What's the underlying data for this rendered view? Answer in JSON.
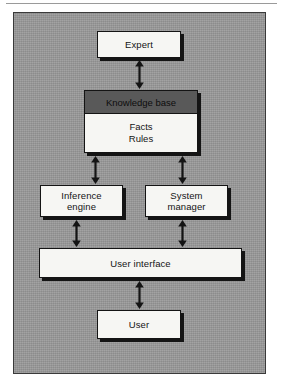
{
  "diagram": {
    "panel_color": "#9a9a9a",
    "box_fill": "#f6f6f3",
    "box_border": "#141414",
    "header_band_color": "#595959",
    "nodes": [
      {
        "id": "expert",
        "label": "Expert"
      },
      {
        "id": "knowledge-base",
        "header": "Knowledge base",
        "line1": "Facts",
        "line2": "Rules"
      },
      {
        "id": "inference",
        "line1": "Inference",
        "line2": "engine"
      },
      {
        "id": "system-manager",
        "line1": "System",
        "line2": "manager"
      },
      {
        "id": "user-interface",
        "label": "User interface"
      },
      {
        "id": "user",
        "label": "User"
      }
    ],
    "connectors": [
      {
        "from": "expert",
        "to": "knowledge-base",
        "type": "double-arrow"
      },
      {
        "from": "knowledge-base",
        "to": "inference",
        "type": "double-arrow"
      },
      {
        "from": "knowledge-base",
        "to": "system-manager",
        "type": "double-arrow"
      },
      {
        "from": "inference",
        "to": "user-interface",
        "type": "double-arrow"
      },
      {
        "from": "system-manager",
        "to": "user-interface",
        "type": "double-arrow"
      },
      {
        "from": "user-interface",
        "to": "user",
        "type": "double-arrow"
      }
    ]
  }
}
